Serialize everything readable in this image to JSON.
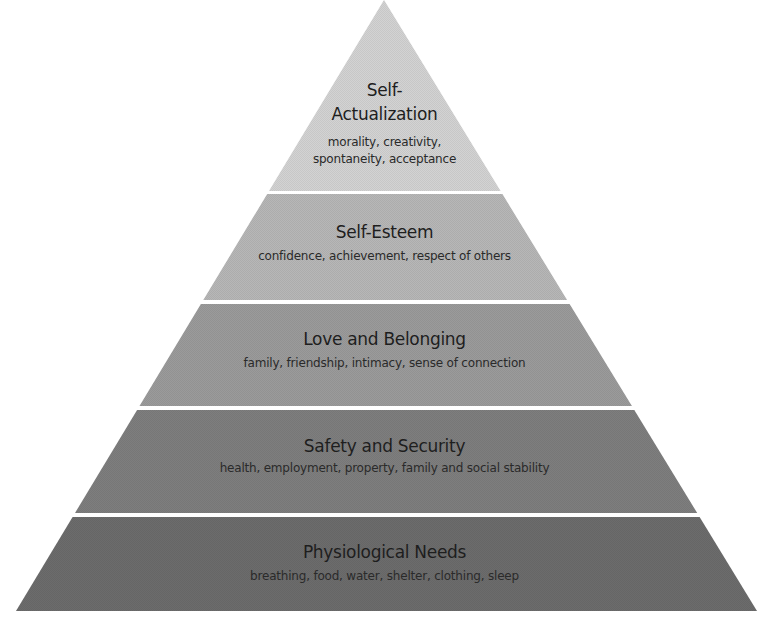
{
  "diagram": {
    "type": "pyramid",
    "apex": {
      "x": 384,
      "y": 0
    },
    "base": {
      "left_x": 16,
      "right_x": 757,
      "y": 611
    },
    "gap_color": "#f2f2f2",
    "tiers": [
      {
        "level": 5,
        "title_line1": "Self-",
        "title_line2": "Actualization",
        "desc_line1": "morality, creativity,",
        "desc_line2": "spontaneity, acceptance",
        "top_y": 0,
        "bottom_y": 191,
        "color": "#d3d3d3"
      },
      {
        "level": 4,
        "title": "Self-Esteem",
        "desc": "confidence, achievement, respect of others",
        "top_y": 194,
        "bottom_y": 300,
        "color": "#b7b7b7"
      },
      {
        "level": 3,
        "title": "Love and Belonging",
        "desc": "family, friendship, intimacy, sense of connection",
        "top_y": 304,
        "bottom_y": 406,
        "color": "#9b9b9b"
      },
      {
        "level": 2,
        "title": "Safety and Security",
        "desc": "health, employment, property, family and social stability",
        "top_y": 410,
        "bottom_y": 513,
        "color": "#7e7e7e"
      },
      {
        "level": 1,
        "title": "Physiological Needs",
        "desc": "breathing, food, water, shelter, clothing, sleep",
        "top_y": 517,
        "bottom_y": 611,
        "color": "#6c6c6c"
      }
    ]
  }
}
